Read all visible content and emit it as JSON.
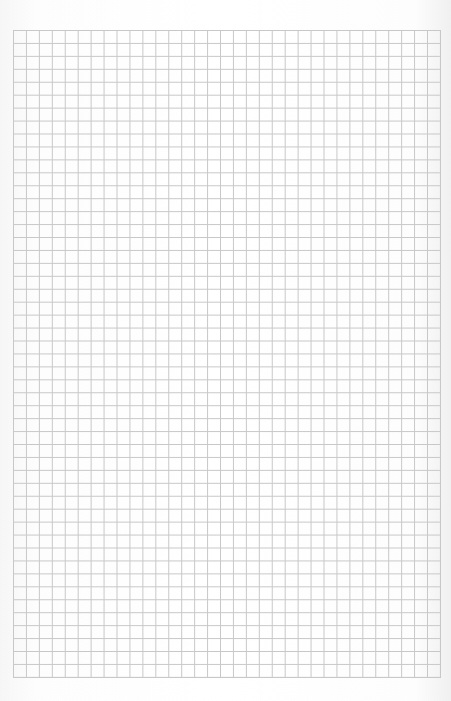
{
  "page": {
    "type": "graph-paper-sheet",
    "background_color": "#ffffff",
    "line_color": "#c8c8c8"
  },
  "grid": {
    "left": 13,
    "top": 30,
    "columns": 33,
    "rows": 50,
    "cell_size": 12.94
  }
}
